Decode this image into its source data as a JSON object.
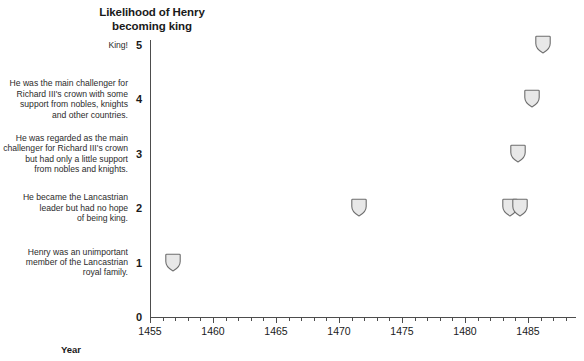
{
  "chart_data": {
    "type": "scatter",
    "title": "Likelihood of Henry\nbecoming king",
    "xlabel": "Year",
    "ylabel": "",
    "xlim": [
      1455,
      1488.8
    ],
    "ylim": [
      0,
      5.4
    ],
    "grid": false,
    "legend": null,
    "marker": "shield",
    "marker_fill": "#e8e8e8",
    "marker_stroke": "#6e6e6e",
    "x_ticks": [
      1455,
      1460,
      1465,
      1470,
      1475,
      1480,
      1485
    ],
    "x_tick_labels": [
      "1455",
      "1460",
      "1465",
      "1470",
      "1475",
      "1480",
      "1485"
    ],
    "x_minor_tick_step": 1,
    "y_ticks": [
      0,
      1,
      2,
      3,
      4,
      5
    ],
    "y_tick_labels": [
      "0",
      "1",
      "2",
      "3",
      "4",
      "5"
    ],
    "y_tick_descriptions": [
      {
        "value": 5,
        "text": "King!"
      },
      {
        "value": 4,
        "text": "He was the main challenger for\nRichard III's crown with some\nsupport from nobles, knights\nand other countries."
      },
      {
        "value": 3,
        "text": "He was regarded as the main\nchallenger for Richard III's crown\nbut had only a little support\nfrom nobles and knights."
      },
      {
        "value": 2,
        "text": "He became the Lancastrian\nleader but had no hope\nof being king."
      },
      {
        "value": 1,
        "text": "Henry was an unimportant\nmember of the Lancastrian\nroyal family."
      }
    ],
    "points": [
      {
        "x": 1456.8,
        "y": 1
      },
      {
        "x": 1471.6,
        "y": 2
      },
      {
        "x": 1483.6,
        "y": 2
      },
      {
        "x": 1484.4,
        "y": 2
      },
      {
        "x": 1484.2,
        "y": 3
      },
      {
        "x": 1485.3,
        "y": 4
      },
      {
        "x": 1486.2,
        "y": 5
      }
    ]
  },
  "colors": {
    "axis": "#4d4d4d",
    "text": "#1a1a1a",
    "annotation_text": "#2b2b2b",
    "marker_fill": "#e8e8e8",
    "marker_stroke": "#6e6e6e",
    "background": "#ffffff"
  }
}
